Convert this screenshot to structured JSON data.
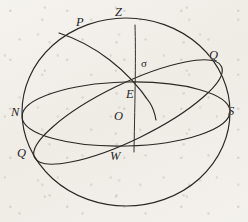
{
  "figure": {
    "background_color": "#f2f0eb",
    "ink_color": "#2a2724",
    "labels": {
      "pole": "P",
      "zenith": "Z",
      "equator_right": "Q",
      "equator_left": "Q",
      "sigma": "σ",
      "east": "E",
      "center": "O",
      "north": "N",
      "south": "S",
      "west": "W"
    },
    "elements": [
      {
        "name": "sphere-outline",
        "kind": "circle"
      },
      {
        "name": "horizon-ellipse",
        "kind": "ellipse"
      },
      {
        "name": "equator-ellipse",
        "kind": "ellipse"
      },
      {
        "name": "meridian-arc",
        "kind": "arc"
      },
      {
        "name": "vertical-circle-line",
        "kind": "line"
      }
    ]
  }
}
